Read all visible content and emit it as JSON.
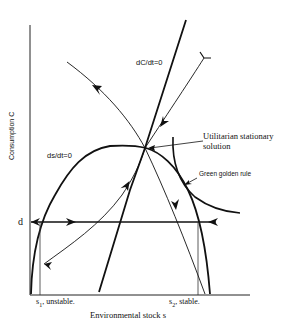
{
  "figure": {
    "y_axis_label": "Consumption C",
    "x_axis_label": "Environmental stock s",
    "curves": {
      "ds_dt_zero": "ds/dt=0",
      "dC_dt_zero": "dC/dt=0",
      "green_golden_rule": "Green golden rule"
    },
    "annotations": {
      "utilitarian": "Utilitarian stationary solution",
      "d_level": "d",
      "s1_prefix": "s",
      "s1_sub": "1",
      "s1_suffix": ", unstable.",
      "s2_prefix": "s",
      "s2_sub": "2",
      "s2_suffix": ", stable."
    },
    "colors": {
      "ink": "#111111",
      "background": "#ffffff"
    }
  }
}
